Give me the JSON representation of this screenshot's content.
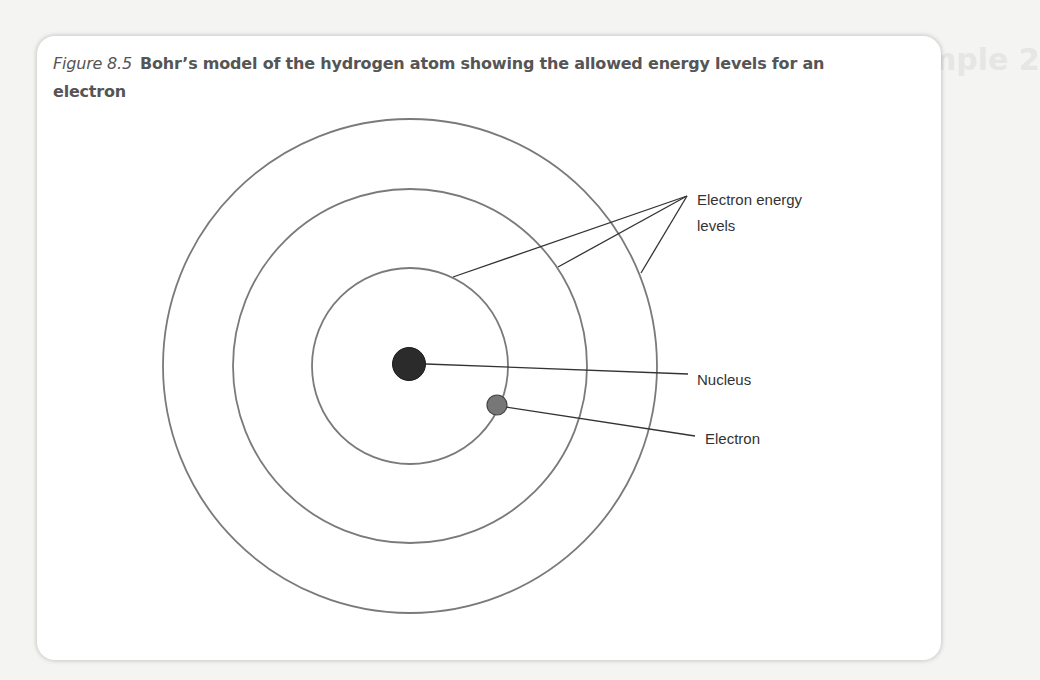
{
  "figure": {
    "number": "Figure 8.5",
    "caption": "Bohr’s model of the hydrogen atom showing the allowed energy levels for an electron"
  },
  "background": {
    "ghost_heading": "mple 2"
  },
  "diagram": {
    "labels": {
      "energy_levels_line1": "Electron energy",
      "energy_levels_line2": "levels",
      "nucleus": "Nucleus",
      "electron": "Electron"
    },
    "colors": {
      "orbit": "#7a7a7a",
      "leader": "#333333",
      "nucleus": "#2b2b2b",
      "electron": "#777777"
    },
    "orbits": [
      {
        "n": 1,
        "radius": 98
      },
      {
        "n": 2,
        "radius": 177
      },
      {
        "n": 3,
        "radius": 247
      }
    ]
  }
}
